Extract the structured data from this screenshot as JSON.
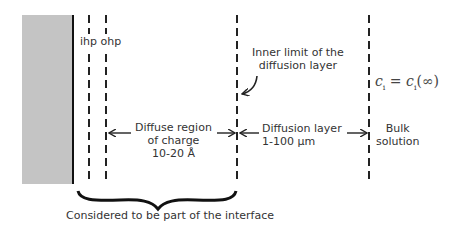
{
  "diagram": {
    "labels": {
      "ihp": "ihp",
      "ohp": "ohp",
      "inner_limit_line1": "Inner limit of the",
      "inner_limit_line2": "diffusion layer",
      "diffuse_line1": "Diffuse region",
      "diffuse_line2": "of charge",
      "diffuse_line3": "10-20 Å",
      "diffusion_line1": "Diffusion layer",
      "diffusion_line2": "1-100 µm",
      "bulk_line1": "Bulk",
      "bulk_line2": "solution",
      "equation_lhs": "c",
      "equation_lhs_sub": "i",
      "equation_eq": " = ",
      "equation_rhs": "c",
      "equation_rhs_sub": "i",
      "equation_rhs_arg": "(∞)",
      "brace_caption": "Considered to be part of the interface"
    },
    "regions": [
      {
        "name": "electrode",
        "color": "#c4c4c4"
      },
      {
        "name": "inner-helmholtz-plane"
      },
      {
        "name": "outer-helmholtz-plane"
      },
      {
        "name": "diffuse-region",
        "extent": "10-20 Å"
      },
      {
        "name": "diffusion-layer",
        "extent": "1-100 µm"
      },
      {
        "name": "bulk-solution"
      }
    ],
    "colors": {
      "electrode": "#c4c4c4",
      "lines": "#222222",
      "text": "#333333"
    }
  }
}
